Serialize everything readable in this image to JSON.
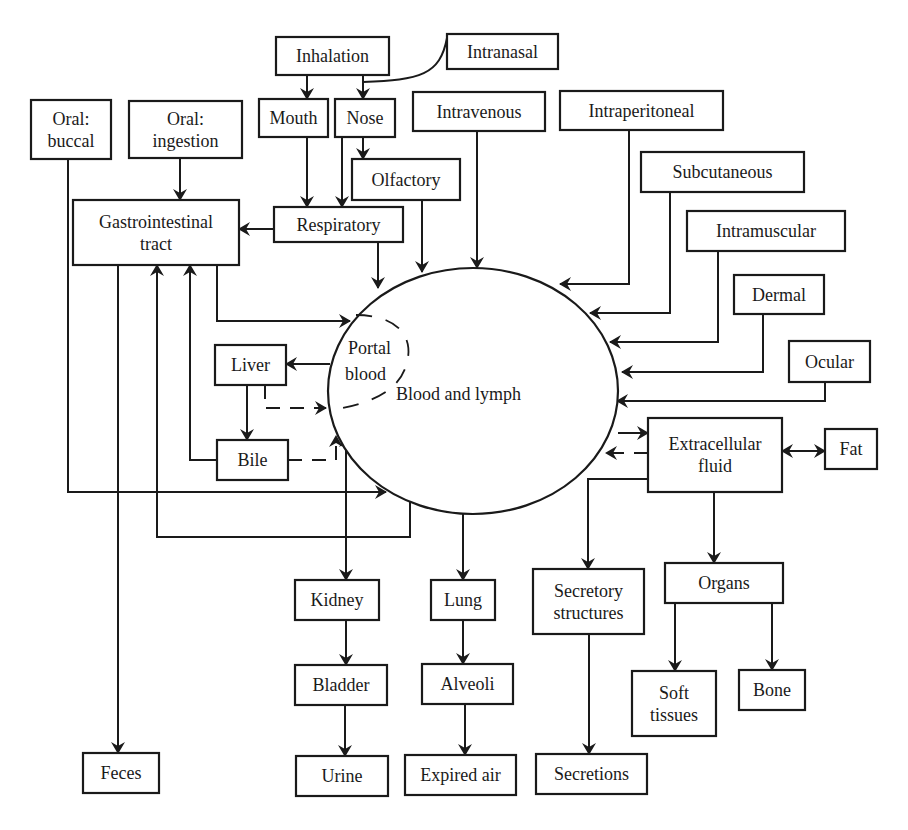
{
  "diagram": {
    "central_compartment": {
      "label": "Blood and lymph",
      "sub_label_line1": "Portal",
      "sub_label_line2": "blood"
    },
    "nodes": [
      {
        "id": "inhalation",
        "lines": [
          "Inhalation"
        ],
        "x": 276,
        "y": 37,
        "w": 113,
        "h": 38
      },
      {
        "id": "intranasal",
        "lines": [
          "Intranasal"
        ],
        "x": 447,
        "y": 34,
        "w": 111,
        "h": 35
      },
      {
        "id": "oral_buccal",
        "lines": [
          "Oral:",
          "buccal"
        ],
        "x": 31,
        "y": 100,
        "w": 80,
        "h": 59
      },
      {
        "id": "oral_ingestion",
        "lines": [
          "Oral:",
          "ingestion"
        ],
        "x": 129,
        "y": 101,
        "w": 113,
        "h": 57
      },
      {
        "id": "mouth",
        "lines": [
          "Mouth"
        ],
        "x": 259,
        "y": 99,
        "w": 69,
        "h": 38
      },
      {
        "id": "nose",
        "lines": [
          "Nose"
        ],
        "x": 335,
        "y": 99,
        "w": 60,
        "h": 38
      },
      {
        "id": "intravenous",
        "lines": [
          "Intravenous"
        ],
        "x": 413,
        "y": 92,
        "w": 132,
        "h": 39
      },
      {
        "id": "intraperitoneal",
        "lines": [
          "Intraperitoneal"
        ],
        "x": 560,
        "y": 91,
        "w": 163,
        "h": 39
      },
      {
        "id": "olfactory",
        "lines": [
          "Olfactory"
        ],
        "x": 352,
        "y": 159,
        "w": 108,
        "h": 41
      },
      {
        "id": "subcutaneous",
        "lines": [
          "Subcutaneous"
        ],
        "x": 641,
        "y": 152,
        "w": 163,
        "h": 40
      },
      {
        "id": "gi_tract",
        "lines": [
          "Gastrointestinal",
          "tract"
        ],
        "x": 73,
        "y": 200,
        "w": 166,
        "h": 65
      },
      {
        "id": "respiratory",
        "lines": [
          "Respiratory"
        ],
        "x": 274,
        "y": 207,
        "w": 129,
        "h": 35
      },
      {
        "id": "intramuscular",
        "lines": [
          "Intramuscular"
        ],
        "x": 687,
        "y": 211,
        "w": 158,
        "h": 40
      },
      {
        "id": "dermal",
        "lines": [
          "Dermal"
        ],
        "x": 734,
        "y": 275,
        "w": 90,
        "h": 39
      },
      {
        "id": "ocular",
        "lines": [
          "Ocular"
        ],
        "x": 789,
        "y": 341,
        "w": 81,
        "h": 41
      },
      {
        "id": "liver",
        "lines": [
          "Liver"
        ],
        "x": 215,
        "y": 345,
        "w": 71,
        "h": 40
      },
      {
        "id": "bile",
        "lines": [
          "Bile"
        ],
        "x": 217,
        "y": 440,
        "w": 71,
        "h": 40
      },
      {
        "id": "extracellular_fluid",
        "lines": [
          "Extracellular",
          "fluid"
        ],
        "x": 648,
        "y": 418,
        "w": 134,
        "h": 74
      },
      {
        "id": "fat",
        "lines": [
          "Fat"
        ],
        "x": 825,
        "y": 429,
        "w": 52,
        "h": 40
      },
      {
        "id": "kidney",
        "lines": [
          "Kidney"
        ],
        "x": 295,
        "y": 580,
        "w": 84,
        "h": 40
      },
      {
        "id": "lung",
        "lines": [
          "Lung"
        ],
        "x": 431,
        "y": 580,
        "w": 64,
        "h": 40
      },
      {
        "id": "secretory_structures",
        "lines": [
          "Secretory",
          "structures"
        ],
        "x": 533,
        "y": 569,
        "w": 111,
        "h": 65
      },
      {
        "id": "organs",
        "lines": [
          "Organs"
        ],
        "x": 665,
        "y": 563,
        "w": 118,
        "h": 40
      },
      {
        "id": "bladder",
        "lines": [
          "Bladder"
        ],
        "x": 295,
        "y": 665,
        "w": 92,
        "h": 40
      },
      {
        "id": "alveoli",
        "lines": [
          "Alveoli"
        ],
        "x": 422,
        "y": 664,
        "w": 91,
        "h": 40
      },
      {
        "id": "soft_tissues",
        "lines": [
          "Soft",
          "tissues"
        ],
        "x": 632,
        "y": 671,
        "w": 84,
        "h": 65
      },
      {
        "id": "bone",
        "lines": [
          "Bone"
        ],
        "x": 739,
        "y": 670,
        "w": 66,
        "h": 40
      },
      {
        "id": "feces",
        "lines": [
          "Feces"
        ],
        "x": 83,
        "y": 753,
        "w": 76,
        "h": 40
      },
      {
        "id": "urine",
        "lines": [
          "Urine"
        ],
        "x": 296,
        "y": 756,
        "w": 92,
        "h": 40
      },
      {
        "id": "expired_air",
        "lines": [
          "Expired air"
        ],
        "x": 405,
        "y": 755,
        "w": 111,
        "h": 40
      },
      {
        "id": "secretions",
        "lines": [
          "Secretions"
        ],
        "x": 536,
        "y": 754,
        "w": 111,
        "h": 40
      }
    ],
    "edges": [
      {
        "from": "inhalation",
        "to": "mouth",
        "points": [
          [
            307,
            75
          ],
          [
            307,
            99
          ]
        ],
        "arrow": "end"
      },
      {
        "from": "inhalation",
        "to": "nose",
        "points": [
          [
            363,
            75
          ],
          [
            363,
            99
          ]
        ],
        "arrow": "end"
      },
      {
        "from": "intranasal",
        "to": "nose",
        "curve": "M447,38 C440,75 420,80 363,82",
        "arrow": "none"
      },
      {
        "from": "nose",
        "to": "olfactory",
        "points": [
          [
            363,
            137
          ],
          [
            363,
            159
          ]
        ],
        "arrow": "end"
      },
      {
        "from": "mouth",
        "to": "respiratory",
        "points": [
          [
            307,
            137
          ],
          [
            307,
            207
          ]
        ],
        "arrow": "end"
      },
      {
        "from": "nose",
        "to": "respiratory",
        "points": [
          [
            342,
            137
          ],
          [
            342,
            207
          ]
        ],
        "arrow": "end"
      },
      {
        "from": "oral_ingestion",
        "to": "gi_tract",
        "points": [
          [
            180,
            158
          ],
          [
            180,
            200
          ]
        ],
        "arrow": "end"
      },
      {
        "from": "respiratory",
        "to": "gi_tract",
        "points": [
          [
            274,
            229
          ],
          [
            239,
            229
          ]
        ],
        "arrow": "end"
      },
      {
        "from": "olfactory",
        "to": "blood",
        "points": [
          [
            422,
            200
          ],
          [
            422,
            272
          ]
        ],
        "arrow": "end"
      },
      {
        "from": "respiratory",
        "to": "blood",
        "points": [
          [
            378,
            242
          ],
          [
            378,
            288
          ]
        ],
        "arrow": "end"
      },
      {
        "from": "intravenous",
        "to": "blood",
        "points": [
          [
            477,
            131
          ],
          [
            477,
            268
          ]
        ],
        "arrow": "end"
      },
      {
        "from": "intraperitoneal",
        "to": "blood",
        "points": [
          [
            629,
            130
          ],
          [
            629,
            284
          ],
          [
            560,
            284
          ]
        ],
        "arrow": "end"
      },
      {
        "from": "subcutaneous",
        "to": "blood",
        "points": [
          [
            670,
            192
          ],
          [
            670,
            313
          ],
          [
            590,
            313
          ]
        ],
        "arrow": "end"
      },
      {
        "from": "intramuscular",
        "to": "blood",
        "points": [
          [
            718,
            251
          ],
          [
            718,
            342
          ],
          [
            610,
            342
          ]
        ],
        "arrow": "end"
      },
      {
        "from": "dermal",
        "to": "blood",
        "points": [
          [
            763,
            314
          ],
          [
            763,
            372
          ],
          [
            622,
            372
          ]
        ],
        "arrow": "end"
      },
      {
        "from": "ocular",
        "to": "blood",
        "points": [
          [
            825,
            382
          ],
          [
            825,
            401
          ],
          [
            617,
            401
          ]
        ],
        "arrow": "end"
      },
      {
        "from": "gi_tract",
        "to": "blood",
        "points": [
          [
            217,
            265
          ],
          [
            217,
            321
          ],
          [
            350,
            321
          ]
        ],
        "arrow": "end"
      },
      {
        "from": "blood",
        "to": "liver",
        "points": [
          [
            330,
            364
          ],
          [
            286,
            364
          ]
        ],
        "arrow": "end"
      },
      {
        "from": "liver",
        "to": "bile",
        "points": [
          [
            247,
            385
          ],
          [
            247,
            440
          ]
        ],
        "arrow": "end"
      },
      {
        "from": "liver",
        "to": "blood",
        "points": [
          [
            265,
            385
          ],
          [
            265,
            408
          ],
          [
            326,
            408
          ]
        ],
        "arrow": "end",
        "dashed": true
      },
      {
        "from": "bile",
        "to": "blood",
        "points": [
          [
            288,
            460
          ],
          [
            336,
            460
          ],
          [
            336,
            436
          ]
        ],
        "arrow": "end",
        "dashed": true
      },
      {
        "from": "bile",
        "to": "gi_tract",
        "points": [
          [
            217,
            460
          ],
          [
            190,
            460
          ],
          [
            190,
            265
          ]
        ],
        "arrow": "end"
      },
      {
        "from": "blood",
        "to": "gi_tract",
        "points": [
          [
            410,
            477
          ],
          [
            410,
            537
          ],
          [
            157,
            537
          ],
          [
            157,
            265
          ]
        ],
        "arrow": "end"
      },
      {
        "from": "oral_buccal",
        "to": "blood",
        "points": [
          [
            68,
            159
          ],
          [
            68,
            492
          ],
          [
            386,
            492
          ]
        ],
        "arrow": "end"
      },
      {
        "from": "gi_tract",
        "to": "feces",
        "points": [
          [
            118,
            265
          ],
          [
            118,
            753
          ]
        ],
        "arrow": "end"
      },
      {
        "from": "kidney_link",
        "to": "kidney",
        "points": [
          [
            346,
            436
          ],
          [
            346,
            580
          ]
        ],
        "arrow": "both_start_up"
      },
      {
        "from": "kidney",
        "to": "bladder",
        "points": [
          [
            346,
            620
          ],
          [
            346,
            665
          ]
        ],
        "arrow": "end"
      },
      {
        "from": "bladder",
        "to": "urine",
        "points": [
          [
            345,
            705
          ],
          [
            345,
            756
          ]
        ],
        "arrow": "end"
      },
      {
        "from": "blood",
        "to": "lung",
        "points": [
          [
            463,
            510
          ],
          [
            463,
            580
          ]
        ],
        "arrow": "end"
      },
      {
        "from": "lung",
        "to": "alveoli",
        "points": [
          [
            463,
            620
          ],
          [
            463,
            664
          ]
        ],
        "arrow": "end"
      },
      {
        "from": "alveoli",
        "to": "expired_air",
        "points": [
          [
            465,
            704
          ],
          [
            465,
            755
          ]
        ],
        "arrow": "end"
      },
      {
        "from": "blood",
        "to": "extracellular_fluid",
        "points": [
          [
            618,
            433
          ],
          [
            648,
            433
          ]
        ],
        "arrow": "end"
      },
      {
        "from": "extracellular_fluid",
        "to": "blood",
        "points": [
          [
            648,
            453
          ],
          [
            606,
            453
          ]
        ],
        "arrow": "end",
        "dashed": true
      },
      {
        "from": "extracellular_fluid",
        "to": "fat",
        "points": [
          [
            782,
            451
          ],
          [
            825,
            451
          ]
        ],
        "arrow": "both"
      },
      {
        "from": "extracellular_fluid",
        "to": "secretory_structures",
        "points": [
          [
            648,
            479
          ],
          [
            588,
            479
          ],
          [
            588,
            569
          ]
        ],
        "arrow": "end"
      },
      {
        "from": "extracellular_fluid",
        "to": "organs",
        "points": [
          [
            714,
            492
          ],
          [
            714,
            563
          ]
        ],
        "arrow": "end"
      },
      {
        "from": "secretory_structures",
        "to": "secretions",
        "points": [
          [
            589,
            634
          ],
          [
            589,
            754
          ]
        ],
        "arrow": "end"
      },
      {
        "from": "organs",
        "to": "soft_tissues",
        "points": [
          [
            675,
            603
          ],
          [
            675,
            671
          ]
        ],
        "arrow": "end"
      },
      {
        "from": "organs",
        "to": "bone",
        "points": [
          [
            772,
            603
          ],
          [
            772,
            670
          ]
        ],
        "arrow": "end"
      }
    ]
  }
}
